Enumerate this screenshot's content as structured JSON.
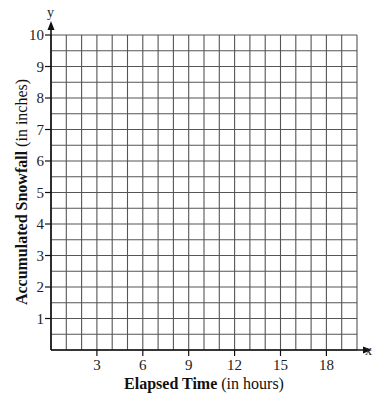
{
  "chart_data": {
    "type": "line",
    "title": "",
    "xlabel": "Elapsed Time",
    "xlabel_unit": "(in hours)",
    "ylabel": "Accumulated Snowfall",
    "ylabel_unit": "(in inches)",
    "x_axis_letter": "x",
    "y_axis_letter": "y",
    "xlim": [
      0,
      20
    ],
    "ylim": [
      0,
      10
    ],
    "x_ticks": [
      3,
      6,
      9,
      12,
      15,
      18
    ],
    "y_ticks": [
      1,
      2,
      3,
      4,
      5,
      6,
      7,
      8,
      9,
      10
    ],
    "x_grid_step": 1,
    "y_grid_step": 0.5,
    "grid": true,
    "series": []
  },
  "colors": {
    "grid": "#555555",
    "axis": "#111111",
    "background": "#ffffff"
  }
}
